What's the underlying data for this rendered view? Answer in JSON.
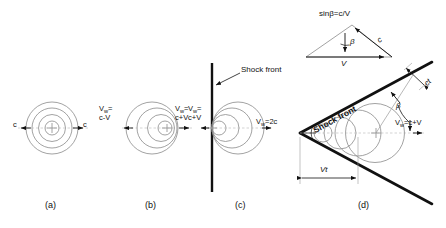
{
  "figure": {
    "type": "physics-diagram",
    "topic": "Propagation of sound waves from a moving source and formation of a shock (Mach) cone",
    "panels": [
      {
        "id": "a",
        "caption": "(a)",
        "regime": "stationary source, V = 0",
        "labels": [
          {
            "name": "wave-speed-left",
            "text": "c"
          },
          {
            "name": "wave-speed-right",
            "text": "c"
          }
        ]
      },
      {
        "id": "b",
        "caption": "(b)",
        "regime": "subsonic source, V < c",
        "labels": [
          {
            "name": "upstream-wave-speed",
            "line1": "V",
            "sub": "w",
            "eq": "=",
            "line2": "c-V"
          },
          {
            "name": "downstream-wave-speed",
            "line1": "V",
            "sub": "w",
            "eq": "=",
            "line2": "c+V"
          }
        ]
      },
      {
        "id": "c",
        "caption": "(c)",
        "regime": "sonic source, V = c, shock front forms",
        "labels": [
          {
            "name": "shock-front-label",
            "text": "Shock front"
          },
          {
            "name": "upstream-wave-speed",
            "line1": "V",
            "sub": "w",
            "eq": "=",
            "line2": "c+V"
          },
          {
            "name": "downstream-wave-speed",
            "text": "V",
            "sub": "w",
            "rest": "=2c"
          }
        ]
      },
      {
        "id": "d",
        "caption": "(d)",
        "regime": "supersonic source, V > c, Mach cone",
        "labels": [
          {
            "name": "mach-angle-relation",
            "text": "sinβ=c/V"
          },
          {
            "name": "vector-c",
            "text": "c"
          },
          {
            "name": "vector-V",
            "text": "V"
          },
          {
            "name": "beta-vector-angle",
            "text": "β"
          },
          {
            "name": "shock-front-label",
            "text": "Shock front"
          },
          {
            "name": "ct-distance",
            "text": "ct"
          },
          {
            "name": "beta-cone-angle",
            "text": "β"
          },
          {
            "name": "wave-speed",
            "text": "V",
            "sub": "w",
            "rest": "=c+V"
          },
          {
            "name": "vt-distance",
            "text": "Vt"
          }
        ]
      }
    ],
    "captions": [
      "(a)",
      "(b)",
      "(c)",
      "(d)"
    ],
    "colors": {
      "wavefront": "#8a8a8a",
      "shock": "#111111",
      "axis": "#9a9a9a",
      "text": "#111111",
      "background": "#ffffff"
    }
  }
}
